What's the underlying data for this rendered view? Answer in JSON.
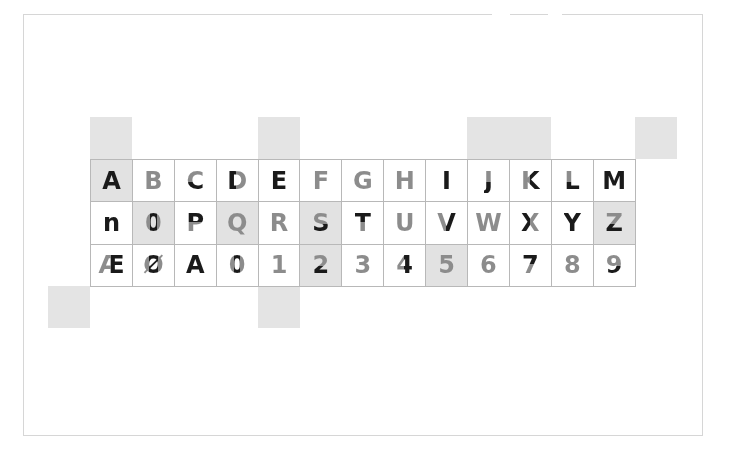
{
  "colors": {
    "dark": "#1a1a1a",
    "grey": "#8c8c8c",
    "shade": "#e2e2e2",
    "block": "#e4e4e4",
    "grid_line": "#b8b8b8",
    "frame": "#d6d6d6"
  },
  "rows": [
    [
      {
        "char": "A",
        "shaded": true,
        "split": "dark"
      },
      {
        "char": "B",
        "shaded": false,
        "split": "grey"
      },
      {
        "char": "C",
        "shaded": false,
        "split": "bottom-dark"
      },
      {
        "char": "D",
        "shaded": false,
        "split": "left-dark"
      },
      {
        "char": "E",
        "shaded": false,
        "split": "dark"
      },
      {
        "char": "F",
        "shaded": false,
        "split": "grey"
      },
      {
        "char": "G",
        "shaded": false,
        "split": "grey"
      },
      {
        "char": "H",
        "shaded": false,
        "split": "grey"
      },
      {
        "char": "I",
        "shaded": false,
        "split": "dark"
      },
      {
        "char": "J",
        "shaded": false,
        "split": "bottom-dark"
      },
      {
        "char": "K",
        "shaded": false,
        "split": "right-dark"
      },
      {
        "char": "L",
        "shaded": false,
        "split": "bottom-dark"
      },
      {
        "char": "M",
        "shaded": false,
        "split": "dark"
      }
    ],
    [
      {
        "char": "n",
        "shaded": false,
        "split": "dark"
      },
      {
        "char": "0",
        "shaded": true,
        "split": "center-dark"
      },
      {
        "char": "P",
        "shaded": false,
        "split": "top-dark"
      },
      {
        "char": "Q",
        "shaded": true,
        "split": "grey"
      },
      {
        "char": "R",
        "shaded": false,
        "split": "grey"
      },
      {
        "char": "S",
        "shaded": true,
        "split": "bottom-dark"
      },
      {
        "char": "T",
        "shaded": false,
        "split": "top-dark"
      },
      {
        "char": "U",
        "shaded": false,
        "split": "grey"
      },
      {
        "char": "V",
        "shaded": false,
        "split": "right-dark"
      },
      {
        "char": "W",
        "shaded": false,
        "split": "grey"
      },
      {
        "char": "X",
        "shaded": false,
        "split": "left-dark"
      },
      {
        "char": "Y",
        "shaded": false,
        "split": "dark"
      },
      {
        "char": "Z",
        "shaded": true,
        "split": "bottom-dark"
      }
    ],
    [
      {
        "char": "Æ",
        "shaded": false,
        "split": "right-dark"
      },
      {
        "char": "Ø",
        "shaded": false,
        "split": "center-dark"
      },
      {
        "char": "Ȧ",
        "shaded": false,
        "split": "dark"
      },
      {
        "char": "0",
        "shaded": false,
        "split": "center-dark"
      },
      {
        "char": "1",
        "shaded": false,
        "split": "grey"
      },
      {
        "char": "2",
        "shaded": true,
        "split": "bottom-dark"
      },
      {
        "char": "3",
        "shaded": false,
        "split": "grey"
      },
      {
        "char": "4",
        "shaded": false,
        "split": "right-dark"
      },
      {
        "char": "5",
        "shaded": true,
        "split": "grey"
      },
      {
        "char": "6",
        "shaded": false,
        "split": "grey"
      },
      {
        "char": "7",
        "shaded": false,
        "split": "top-dark"
      },
      {
        "char": "8",
        "shaded": false,
        "split": "grey"
      },
      {
        "char": "9",
        "shaded": false,
        "split": "bottom-dark"
      }
    ]
  ],
  "blocks": [
    {
      "name": "block-top-a",
      "left": 90,
      "top": 117,
      "width": 42,
      "height": 42
    },
    {
      "name": "block-top-e",
      "left": 258,
      "top": 117,
      "width": 42,
      "height": 42
    },
    {
      "name": "block-top-jk",
      "left": 467,
      "top": 117,
      "width": 84,
      "height": 42
    },
    {
      "name": "block-top-right",
      "left": 635,
      "top": 117,
      "width": 42,
      "height": 42
    },
    {
      "name": "block-bottom-left",
      "left": 48,
      "top": 286,
      "width": 42,
      "height": 42
    },
    {
      "name": "block-bottom-1",
      "left": 258,
      "top": 286,
      "width": 42,
      "height": 42
    }
  ]
}
